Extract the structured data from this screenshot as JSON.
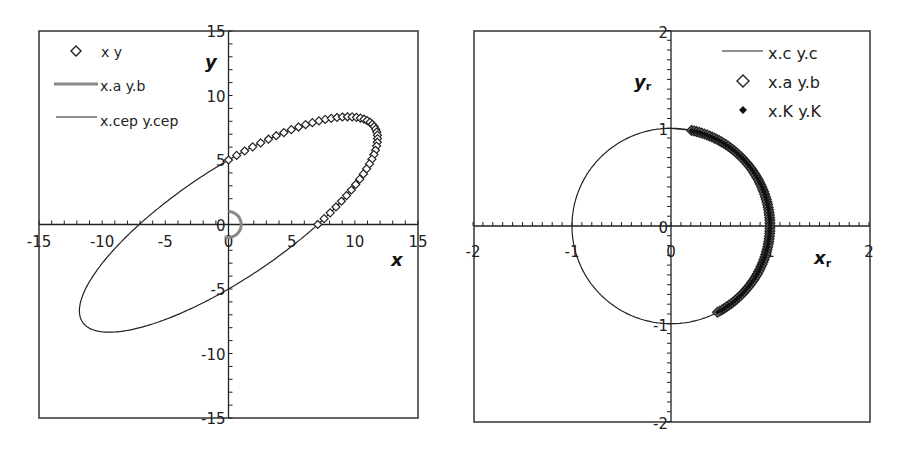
{
  "chart_data": [
    {
      "type": "scatter",
      "title": "",
      "xlabel": "x",
      "ylabel": "y",
      "xlim": [
        -15,
        15
      ],
      "ylim": [
        -15,
        15
      ],
      "x_ticks": [
        "-15",
        "-10",
        "-5",
        "0",
        "5",
        "10",
        "15"
      ],
      "y_ticks": [
        "15",
        "10",
        "5",
        "0",
        "-5",
        "-10",
        "-15"
      ],
      "grid": false,
      "legend_position": "upper-left",
      "series": [
        {
          "name": "x y",
          "style": "open-diamond markers",
          "description": "points along upper-right part of ellipse from (0,5) over (9,8.3) and (11.5,7) down to (7,0)"
        },
        {
          "name": "x.a y.b",
          "style": "thick gray line",
          "description": "small arc near origin, radius ~1, from (0,1) to (0,-1) via (1,0)"
        },
        {
          "name": "x.cep y.cep",
          "style": "thin black line",
          "description": "tilted ellipse through (0,5), (7,0), (0,-5), (-7,0); extremes ~(9,8.3), (11.5,7), (-12,-7), (-9.5,-8.3)"
        }
      ]
    },
    {
      "type": "scatter",
      "title": "",
      "xlabel": "x_r",
      "ylabel": "y_r",
      "xlim": [
        -2,
        2
      ],
      "ylim": [
        -2,
        2
      ],
      "x_ticks": [
        "-2",
        "-1",
        "0",
        "1",
        "2"
      ],
      "y_ticks": [
        "2",
        "1",
        "0",
        "-1",
        "-2"
      ],
      "grid": false,
      "legend_position": "upper-right",
      "series": [
        {
          "name": "x.c y.c",
          "style": "thin black line",
          "description": "unit circle"
        },
        {
          "name": "x.a y.b",
          "style": "open-diamond markers",
          "description": "dense markers on unit circle from angle ~78° (0.2,0.98) to ~-62° (0.47,-0.88)"
        },
        {
          "name": "x.K y.K",
          "style": "small filled-diamond markers",
          "description": "coincident with x.a y.b markers on unit circle"
        }
      ]
    }
  ],
  "left": {
    "legend": [
      "x y",
      "x.a y.b",
      "x.cep y.cep"
    ],
    "xlabel": "x",
    "ylabel": "y",
    "x_ticks": [
      "-15",
      "-10",
      "-5",
      "0",
      "5",
      "10",
      "15"
    ],
    "y_ticks": [
      "15",
      "10",
      "5",
      "0",
      "-5",
      "-10",
      "-15"
    ]
  },
  "right": {
    "legend": [
      "x.c y.c",
      "x.a y.b",
      "x.K y.K"
    ],
    "xlabel": "x",
    "xlabel_sub": "r",
    "ylabel": "y",
    "ylabel_sub": "r",
    "x_ticks": [
      "-2",
      "-1",
      "0",
      "1",
      "2"
    ],
    "y_ticks": [
      "2",
      "1",
      "0",
      "-1",
      "-2"
    ]
  }
}
